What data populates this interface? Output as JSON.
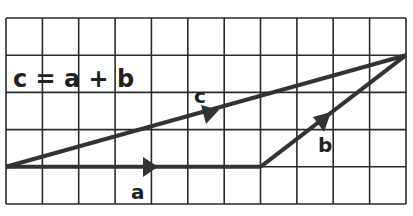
{
  "diagram": {
    "equation": "c = a + b",
    "grid": {
      "columns": 11,
      "rows": 5,
      "left": 6,
      "top": 18,
      "cell_w": 36.36,
      "cell_h": 37.2
    },
    "vectors": [
      {
        "name": "a",
        "label": "a",
        "from": [
          0,
          4
        ],
        "to": [
          7,
          4
        ]
      },
      {
        "name": "b",
        "label": "b",
        "from": [
          7,
          4
        ],
        "to": [
          11,
          1
        ]
      },
      {
        "name": "c",
        "label": "c",
        "from": [
          0,
          4
        ],
        "to": [
          11,
          1
        ]
      }
    ],
    "colors": {
      "grid": "#2a2a2a",
      "vector": "#333333",
      "text": "#222222",
      "background": "#ffffff"
    }
  }
}
